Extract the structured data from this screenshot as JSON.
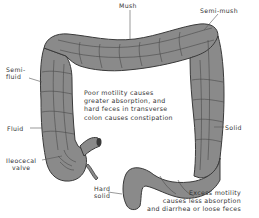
{
  "figure": {
    "colors": {
      "colon_fill": "#8a8a8a",
      "colon_outline": "#3a3a3a",
      "haustra_lines": "#4a4a4a",
      "text": "#333333",
      "background": "#ffffff"
    }
  },
  "labels": {
    "mush": "Mush",
    "semi_mush": "Semi-mush",
    "semi_fluid_line1": "Semi-",
    "semi_fluid_line2": "fluid",
    "fluid": "Fluid",
    "ileocecal_line1": "Ileocecal",
    "ileocecal_line2": "valve",
    "hard_solid_line1": "Hard",
    "hard_solid_line2": "solid",
    "solid": "Solid"
  },
  "notes": {
    "poor_motility": [
      "Poor motility causes",
      "greater absorption, and",
      "hard feces in transverse",
      "colon causes constipation"
    ],
    "excess_motility": [
      "Excess motility",
      "causes less absorption",
      "and diarrhea or loose feces"
    ]
  }
}
